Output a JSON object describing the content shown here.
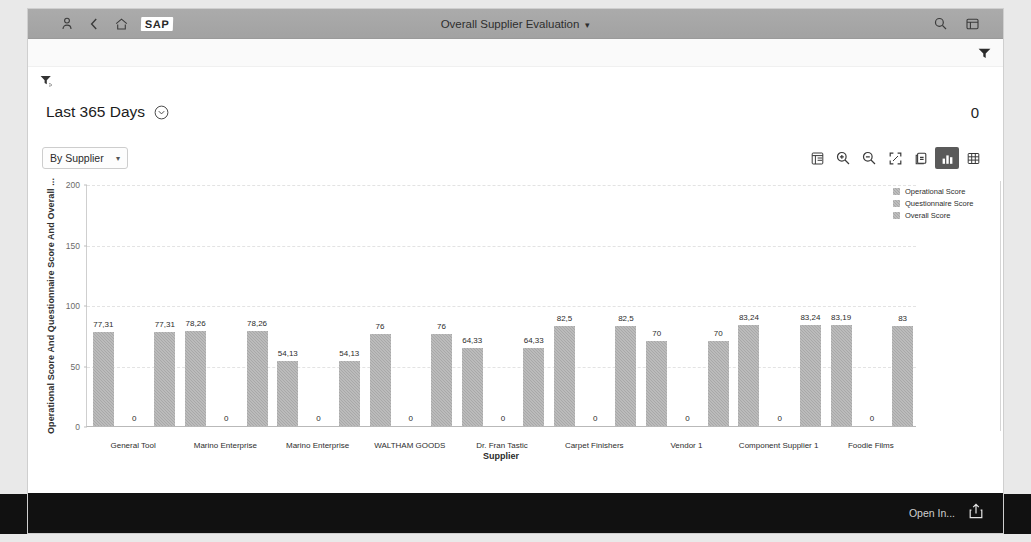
{
  "shell": {
    "title": "Overall Supplier Evaluation",
    "title_chevron": "chevron-down-icon",
    "logo_text": "SAP",
    "left_icons": [
      "user-icon",
      "back-chevron-icon",
      "home-icon"
    ],
    "right_icons": [
      "search-icon",
      "overflow-menu-icon"
    ]
  },
  "filterbar": {
    "filter_icon": "filter-settings-icon",
    "period_label": "Last 365 Days",
    "period_chevron": "chevron-down-circle-icon",
    "kpi_value": "0",
    "caret_icon": "filter-caret-icon"
  },
  "chart_toolbar": {
    "dimension_label": "By Supplier",
    "dimension_chevron": "chevron-down-icon",
    "buttons": [
      {
        "name": "details-icon",
        "active": false
      },
      {
        "name": "zoom-in-icon",
        "active": false
      },
      {
        "name": "zoom-out-icon",
        "active": false
      },
      {
        "name": "fullscreen-icon",
        "active": false
      },
      {
        "name": "export-icon",
        "active": false
      },
      {
        "name": "chart-view-icon",
        "active": true
      },
      {
        "name": "table-view-icon",
        "active": false
      }
    ]
  },
  "chart_data": {
    "type": "bar",
    "title": "",
    "xlabel": "Supplier",
    "ylabel": "Operational Score And Questionnaire Score And Overall ...",
    "ylim": [
      0,
      200
    ],
    "yticks": [
      0,
      50,
      100,
      150,
      200
    ],
    "grid": true,
    "legend_position": "right",
    "legend": [
      "Operational Score",
      "Questionnaire Score",
      "Overall Score"
    ],
    "categories": [
      "General Tool",
      "Marino Enterprise",
      "Marino Enterprise",
      "WALTHAM GOODS",
      "Dr. Fran Tastic",
      "Carpet Finishers",
      "Vendor 1",
      "Component Supplier 1",
      "Foodie Films"
    ],
    "series": [
      {
        "name": "Operational Score",
        "values": [
          77.31,
          78.26,
          54.13,
          76,
          64.33,
          82.5,
          70,
          83.24,
          83.19
        ],
        "labels": [
          "77,31",
          "78,26",
          "54,13",
          "76",
          "64,33",
          "82,5",
          "70",
          "83,24",
          "83,19"
        ]
      },
      {
        "name": "Questionnaire Score",
        "values": [
          0,
          0,
          0,
          0,
          0,
          0,
          0,
          0,
          0
        ],
        "labels": [
          "0",
          "0",
          "0",
          "0",
          "0",
          "0",
          "0",
          "0",
          "0"
        ]
      },
      {
        "name": "Overall Score",
        "values": [
          77.31,
          78.26,
          54.13,
          76,
          64.33,
          82.5,
          70,
          83.24,
          83
        ],
        "labels": [
          "77,31",
          "78,26",
          "54,13",
          "76",
          "64,33",
          "82,5",
          "70",
          "83,24",
          "83"
        ]
      }
    ]
  },
  "bottom": {
    "open_in_label": "Open In...",
    "share_icon": "share-icon"
  }
}
